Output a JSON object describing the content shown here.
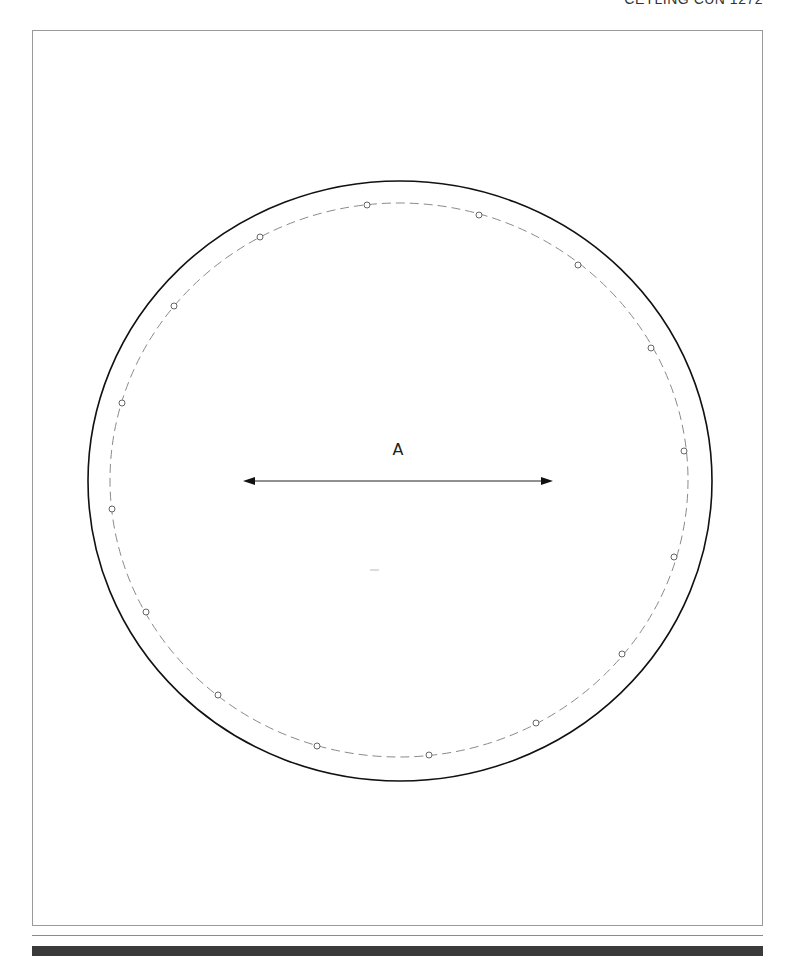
{
  "header": {
    "text": "CEYLING CUN 1272"
  },
  "diagram": {
    "dimension_label": "A",
    "outer_circle": {
      "cx": 400,
      "cy": 481,
      "rx": 312,
      "ry": 300,
      "stroke": "#111111"
    },
    "bolt_circle": {
      "cx": 399,
      "cy": 480,
      "rx": 289,
      "ry": 277,
      "stroke": "#8a8a8a",
      "style": "dashed"
    },
    "holes": [
      [
        367,
        205
      ],
      [
        479,
        215
      ],
      [
        578,
        265
      ],
      [
        651,
        348
      ],
      [
        684,
        451
      ],
      [
        674,
        557
      ],
      [
        622,
        654
      ],
      [
        536,
        723
      ],
      [
        429,
        755
      ],
      [
        317,
        746
      ],
      [
        218,
        695
      ],
      [
        146,
        612
      ],
      [
        112,
        509
      ],
      [
        122,
        403
      ],
      [
        174,
        306
      ],
      [
        260,
        237
      ]
    ],
    "arrow": {
      "x1": 243,
      "x2": 553,
      "y": 481
    }
  }
}
